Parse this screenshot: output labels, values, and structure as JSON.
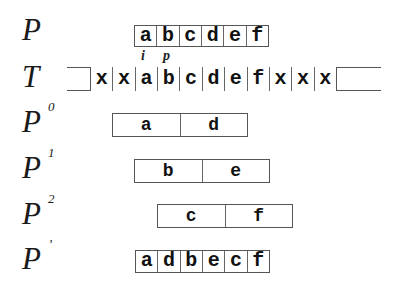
{
  "rows": {
    "P": {
      "label": "P",
      "sup": "",
      "cells": [
        "a",
        "b",
        "c",
        "d",
        "e",
        "f"
      ]
    },
    "T": {
      "label": "T",
      "sup": "",
      "cells": [
        "x",
        "x",
        "a",
        "b",
        "c",
        "d",
        "e",
        "f",
        "x",
        "x",
        "x"
      ]
    },
    "P0": {
      "label": "P",
      "sup": "0",
      "cells": [
        "a",
        "d"
      ]
    },
    "P1": {
      "label": "P",
      "sup": "1",
      "cells": [
        "b",
        "e"
      ]
    },
    "P2": {
      "label": "P",
      "sup": "2",
      "cells": [
        "c",
        "f"
      ]
    },
    "Pprime": {
      "label": "P",
      "sup": "’",
      "cells": [
        "a",
        "d",
        "b",
        "e",
        "c",
        "f"
      ]
    }
  },
  "markers": {
    "i": "i",
    "p": "p"
  }
}
